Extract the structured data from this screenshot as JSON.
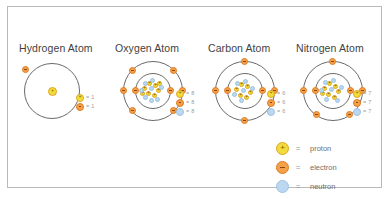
{
  "figure": {
    "background_color": "#ffffff",
    "border_color": "#b9b9b9"
  },
  "colors": {
    "proton_fill": "#f2dc3c",
    "proton_stroke": "#e0a61e",
    "electron_fill": "#f5a04a",
    "electron_stroke": "#e07b20",
    "neutron_fill": "#bcd8f0",
    "neutron_stroke": "#9dc2e2",
    "shell_stroke": "#6a6a6a",
    "title_color": "#3f3f3f",
    "legend_text_color": "#6f6f6f"
  },
  "atoms": [
    {
      "id": "hydrogen",
      "title": "Hydrogen Atom",
      "shells": 1,
      "nucleus": {
        "protons": 1,
        "neutrons": 0
      },
      "electrons_per_shell": [
        1
      ],
      "counts": [
        {
          "particle": "proton",
          "equals": "=",
          "value": "1"
        },
        {
          "particle": "electron",
          "equals": "=",
          "value": "1"
        }
      ]
    },
    {
      "id": "oxygen",
      "title": "Oxygen Atom",
      "shells": 2,
      "nucleus": {
        "protons": 8,
        "neutrons": 8
      },
      "electrons_per_shell": [
        2,
        6
      ],
      "counts": [
        {
          "particle": "proton",
          "equals": "=",
          "value": "8"
        },
        {
          "particle": "electron",
          "equals": "=",
          "value": "8"
        },
        {
          "particle": "neutron",
          "equals": "=",
          "value": "8"
        }
      ]
    },
    {
      "id": "carbon",
      "title": "Carbon Atom",
      "shells": 2,
      "nucleus": {
        "protons": 6,
        "neutrons": 6
      },
      "electrons_per_shell": [
        2,
        4
      ],
      "counts": [
        {
          "particle": "proton",
          "equals": "=",
          "value": "6"
        },
        {
          "particle": "electron",
          "equals": "=",
          "value": "6"
        },
        {
          "particle": "neutron",
          "equals": "=",
          "value": "6"
        }
      ]
    },
    {
      "id": "nitrogen",
      "title": "Nitrogen Atom",
      "shells": 2,
      "nucleus": {
        "protons": 7,
        "neutrons": 7
      },
      "electrons_per_shell": [
        2,
        5
      ],
      "counts": [
        {
          "particle": "proton",
          "equals": "=",
          "value": "7"
        },
        {
          "particle": "electron",
          "equals": "=",
          "value": "7"
        },
        {
          "particle": "neutron",
          "equals": "=",
          "value": "7"
        }
      ]
    }
  ],
  "legend": {
    "rows": [
      {
        "particle": "proton",
        "equals": "=",
        "label": "proton"
      },
      {
        "particle": "electron",
        "equals": "=",
        "label": "electron"
      },
      {
        "particle": "neutron",
        "equals": "=",
        "label": "neutron"
      }
    ]
  }
}
